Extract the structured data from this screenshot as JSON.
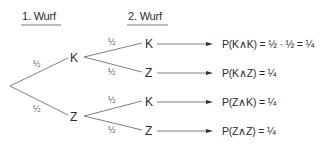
{
  "headers": {
    "first_throw": "1. Wurf",
    "second_throw": "2. Wurf"
  },
  "level1": [
    {
      "label": "K",
      "probability": "½"
    },
    {
      "label": "Z",
      "probability": "½"
    }
  ],
  "level2": [
    {
      "label": "K",
      "probability": "½",
      "result": "P(K∧K) = ½ · ½ = ¼"
    },
    {
      "label": "Z",
      "probability": "½",
      "result": "P(K∧Z) = ¼"
    },
    {
      "label": "K",
      "probability": "½",
      "result": "P(Z∧K) = ¼"
    },
    {
      "label": "Z",
      "probability": "½",
      "result": "P(Z∧Z) = ¼"
    }
  ],
  "colors": {
    "text": "#2b2b2b",
    "lines": "#707070"
  }
}
